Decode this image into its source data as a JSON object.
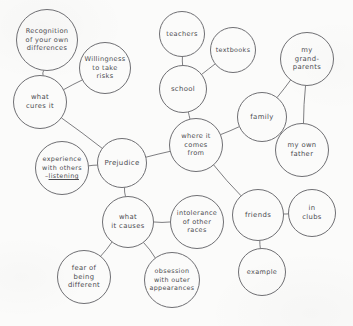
{
  "diagram": {
    "type": "hand-drawn bubble concept map",
    "ink_color": "#4b4b50",
    "outline_color": "#6f6f73",
    "paper_color": "#fbfbfa",
    "nodes": [
      {
        "id": "recognition",
        "label": "Recognition\nof your own\ndifferences",
        "cx": 47,
        "cy": 40,
        "r": 31,
        "font": 6.6
      },
      {
        "id": "willingness",
        "label": "Willingness\nto take\nrisks",
        "cx": 105,
        "cy": 68,
        "r": 26,
        "font": 6.6
      },
      {
        "id": "what-cures-it",
        "label": "what\ncures it",
        "cx": 40,
        "cy": 102,
        "r": 27,
        "font": 6.8
      },
      {
        "id": "experience",
        "label": "experience\nwith others\n–listening",
        "cx": 62,
        "cy": 168,
        "r": 27,
        "font": 6.4,
        "underline_last": true
      },
      {
        "id": "prejudice",
        "label": "Prejudice",
        "cx": 122,
        "cy": 163,
        "r": 25,
        "font": 7.0
      },
      {
        "id": "what-causes",
        "label": "what\nit causes",
        "cx": 128,
        "cy": 222,
        "r": 26,
        "font": 6.8
      },
      {
        "id": "fear",
        "label": "fear of\nbeing\ndifferent",
        "cx": 84,
        "cy": 277,
        "r": 27,
        "font": 6.8
      },
      {
        "id": "obsession",
        "label": "obsession\nwith outer\nappearances",
        "cx": 172,
        "cy": 280,
        "r": 28,
        "font": 6.4
      },
      {
        "id": "intolerance",
        "label": "intolerance\nof other\nraces",
        "cx": 197,
        "cy": 222,
        "r": 27,
        "font": 6.5
      },
      {
        "id": "where-from",
        "label": "where it\ncomes\nfrom",
        "cx": 196,
        "cy": 145,
        "r": 27,
        "font": 6.6
      },
      {
        "id": "school",
        "label": "school",
        "cx": 183,
        "cy": 89,
        "r": 24,
        "font": 6.9
      },
      {
        "id": "teachers",
        "label": "teachers",
        "cx": 182,
        "cy": 34,
        "r": 23,
        "font": 6.6
      },
      {
        "id": "textbooks",
        "label": "textbooks",
        "cx": 233,
        "cy": 50,
        "r": 23,
        "font": 6.4
      },
      {
        "id": "family",
        "label": "family",
        "cx": 262,
        "cy": 117,
        "r": 25,
        "font": 6.9
      },
      {
        "id": "grandparents",
        "label": "my\ngrand-\nparents",
        "cx": 307,
        "cy": 59,
        "r": 27,
        "font": 6.8
      },
      {
        "id": "own-father",
        "label": "my own\nfather",
        "cx": 302,
        "cy": 150,
        "r": 27,
        "font": 6.8
      },
      {
        "id": "friends",
        "label": "friends",
        "cx": 258,
        "cy": 215,
        "r": 26,
        "font": 6.9
      },
      {
        "id": "in-clubs",
        "label": "in\nclubs",
        "cx": 312,
        "cy": 213,
        "r": 24,
        "font": 6.8
      },
      {
        "id": "example",
        "label": "example",
        "cx": 262,
        "cy": 272,
        "r": 24,
        "font": 6.5
      }
    ],
    "edges": [
      {
        "from": "recognition",
        "to": "what-cures-it"
      },
      {
        "from": "willingness",
        "to": "what-cures-it"
      },
      {
        "from": "what-cures-it",
        "to": "prejudice"
      },
      {
        "from": "experience",
        "to": "prejudice"
      },
      {
        "from": "prejudice",
        "to": "where-from"
      },
      {
        "from": "prejudice",
        "to": "what-causes"
      },
      {
        "from": "what-causes",
        "to": "fear"
      },
      {
        "from": "what-causes",
        "to": "obsession"
      },
      {
        "from": "what-causes",
        "to": "intolerance"
      },
      {
        "from": "where-from",
        "to": "school"
      },
      {
        "from": "school",
        "to": "teachers"
      },
      {
        "from": "school",
        "to": "textbooks"
      },
      {
        "from": "where-from",
        "to": "family"
      },
      {
        "from": "family",
        "to": "grandparents"
      },
      {
        "from": "family",
        "to": "own-father"
      },
      {
        "from": "grandparents",
        "to": "own-father"
      },
      {
        "from": "where-from",
        "to": "friends"
      },
      {
        "from": "friends",
        "to": "in-clubs"
      },
      {
        "from": "friends",
        "to": "example"
      }
    ]
  }
}
